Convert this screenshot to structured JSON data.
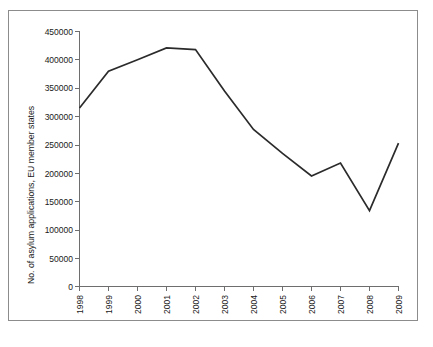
{
  "figure": {
    "background_color": "#ffffff",
    "frame_color": "#8c8c8c",
    "caption_fragment": ""
  },
  "chart_data": {
    "type": "line",
    "title": "",
    "xlabel": "",
    "ylabel": "No. of asylum applications, EU member states",
    "categories": [
      "1998",
      "1999",
      "2000",
      "2001",
      "2002",
      "2003",
      "2004",
      "2005",
      "2006",
      "2007",
      "2008",
      "2009"
    ],
    "values": [
      315000,
      380000,
      400000,
      421000,
      418000,
      345000,
      277000,
      235000,
      195000,
      218000,
      134000,
      253000
    ],
    "series": [
      {
        "name": "No. of asylum applications, EU member states",
        "values": [
          315000,
          380000,
          400000,
          421000,
          418000,
          345000,
          277000,
          235000,
          195000,
          218000,
          134000,
          253000
        ]
      }
    ],
    "ylim": [
      0,
      450000
    ],
    "xlim": [
      "1998",
      "2009"
    ],
    "yticks": [
      0,
      50000,
      100000,
      150000,
      200000,
      250000,
      300000,
      350000,
      400000,
      450000
    ],
    "ytick_labels": [
      "0",
      "50000",
      "100000",
      "150000",
      "200000",
      "250000",
      "300000",
      "350000",
      "400000",
      "450000"
    ],
    "xtick_labels": [
      "1998",
      "1999",
      "2000",
      "2001",
      "2002",
      "2003",
      "2004",
      "2005",
      "2006",
      "2007",
      "2008",
      "2009"
    ],
    "xtick_rotation": -90,
    "grid": false,
    "legend": false,
    "legend_position": "none",
    "line_color": "#2b2b2b",
    "axis_color": "#6e6e6e"
  }
}
